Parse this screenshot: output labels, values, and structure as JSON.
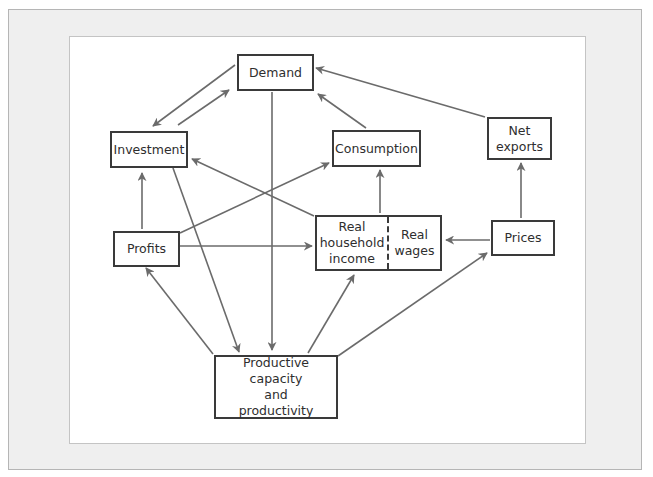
{
  "diagram": {
    "colors": {
      "frame_background": "#efefef",
      "panel_background": "#ffffff",
      "box_border": "#3a3a3a",
      "arrow": "#6b6b6b",
      "text": "#2e2e2e"
    },
    "nodes": {
      "demand": {
        "lines": [
          "Demand"
        ]
      },
      "investment": {
        "lines": [
          "Investment"
        ]
      },
      "consumption": {
        "lines": [
          "Consumption"
        ]
      },
      "net_exports": {
        "lines": [
          "Net",
          "exports"
        ]
      },
      "profits": {
        "lines": [
          "Profits"
        ]
      },
      "real_household_income": {
        "lines": [
          "Real",
          "household",
          "income"
        ]
      },
      "real_wages": {
        "lines": [
          "Real",
          "wages"
        ]
      },
      "prices": {
        "lines": [
          "Prices"
        ]
      },
      "productive_capacity": {
        "lines": [
          "Productive capacity",
          "and",
          "productivity"
        ]
      }
    },
    "edges": [
      {
        "from": "Demand",
        "to": "Investment"
      },
      {
        "from": "Investment",
        "to": "Demand"
      },
      {
        "from": "Consumption",
        "to": "Demand"
      },
      {
        "from": "Net exports",
        "to": "Demand"
      },
      {
        "from": "Demand",
        "to": "Productive capacity and productivity"
      },
      {
        "from": "Profits",
        "to": "Investment"
      },
      {
        "from": "Profits",
        "to": "Consumption"
      },
      {
        "from": "Profits",
        "to": "Real household income"
      },
      {
        "from": "Real household income",
        "to": "Investment"
      },
      {
        "from": "Real household income",
        "to": "Consumption"
      },
      {
        "from": "Prices",
        "to": "Real wages"
      },
      {
        "from": "Prices",
        "to": "Net exports"
      },
      {
        "from": "Investment",
        "to": "Productive capacity and productivity"
      },
      {
        "from": "Productive capacity and productivity",
        "to": "Profits"
      },
      {
        "from": "Productive capacity and productivity",
        "to": "Real household income"
      },
      {
        "from": "Productive capacity and productivity",
        "to": "Prices"
      }
    ]
  }
}
